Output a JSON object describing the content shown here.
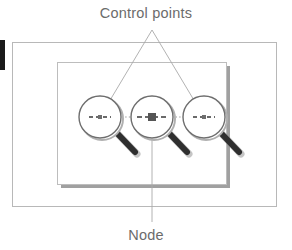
{
  "figure": {
    "title_label": "Control points",
    "node_label": "Node",
    "colors": {
      "outer_frame_stroke": "#b8b8b8",
      "inner_frame_stroke": "#bdbdbd",
      "inner_frame_shadow": "#8f8f8f",
      "circle_stroke": "#6e6e6e",
      "circle_shadow": "#b0b0b0",
      "handle_dark": "#2f2f2f",
      "handle_light": "#5a5a5a",
      "leader_line": "#a9a9a9",
      "dotted_path": "#9a9a9a",
      "dashed_crosshair": "#3a3a3a",
      "node_square": "#555555",
      "text": "#6b6b6b",
      "edge_marker": "#1a1a1a",
      "background": "#ffffff"
    },
    "outer_frame": {
      "x": 12,
      "y": 42,
      "width": 265,
      "height": 165
    },
    "inner_frame": {
      "x": 57,
      "y": 62,
      "width": 170,
      "height": 123
    },
    "edge_marker": {
      "x": 0,
      "y": 40,
      "width": 5,
      "height": 30
    },
    "leader_apex": {
      "x": 152,
      "y": 30
    },
    "node_leader": {
      "x": 152,
      "y1": 122,
      "y2": 222
    },
    "title_position": {
      "x": 146,
      "y": 18
    },
    "node_label_position": {
      "x": 146,
      "y": 240
    },
    "control_points": [
      {
        "name": "left-control-point",
        "cx": 100,
        "cy": 117,
        "r": 21,
        "is_node": false
      },
      {
        "name": "center-node-point",
        "cx": 152,
        "cy": 117,
        "r": 21,
        "is_node": true
      },
      {
        "name": "right-control-point",
        "cx": 204,
        "cy": 117,
        "r": 21,
        "is_node": false
      }
    ],
    "connector_path": {
      "x1": 100,
      "x2": 204,
      "y": 117
    }
  }
}
